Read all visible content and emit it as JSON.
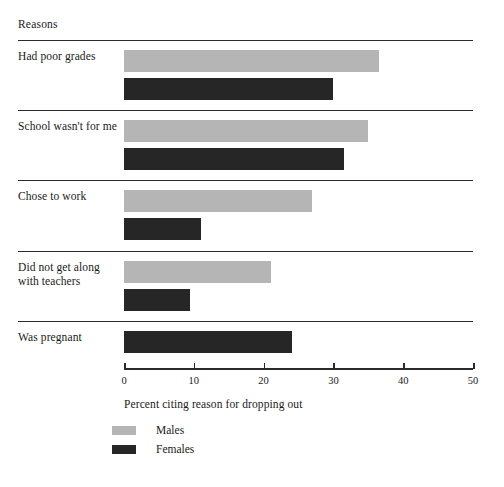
{
  "chart_data": {
    "type": "bar",
    "orientation": "horizontal",
    "title": "",
    "category_header": "Reasons",
    "categories": [
      "Had poor grades",
      "School wasn't for me",
      "Chose to work",
      "Did not get along with teachers",
      "Was pregnant"
    ],
    "series": [
      {
        "name": "Males",
        "color": "#b5b5b5",
        "values": [
          36.5,
          35.0,
          27.0,
          21.0,
          null
        ]
      },
      {
        "name": "Females",
        "color": "#262626",
        "values": [
          30.0,
          31.5,
          11.0,
          9.5,
          24.0
        ]
      }
    ],
    "xlabel": "Percent citing reason for dropping out",
    "ylabel": "",
    "xlim": [
      0,
      50
    ],
    "xticks": [
      0,
      10,
      20,
      30,
      40,
      50
    ],
    "xtick_labels": [
      "0",
      "10",
      "20",
      "30",
      "40",
      "50"
    ],
    "grid": false,
    "legend_position": "bottom-left",
    "legend_entries": [
      "Males",
      "Females"
    ]
  }
}
